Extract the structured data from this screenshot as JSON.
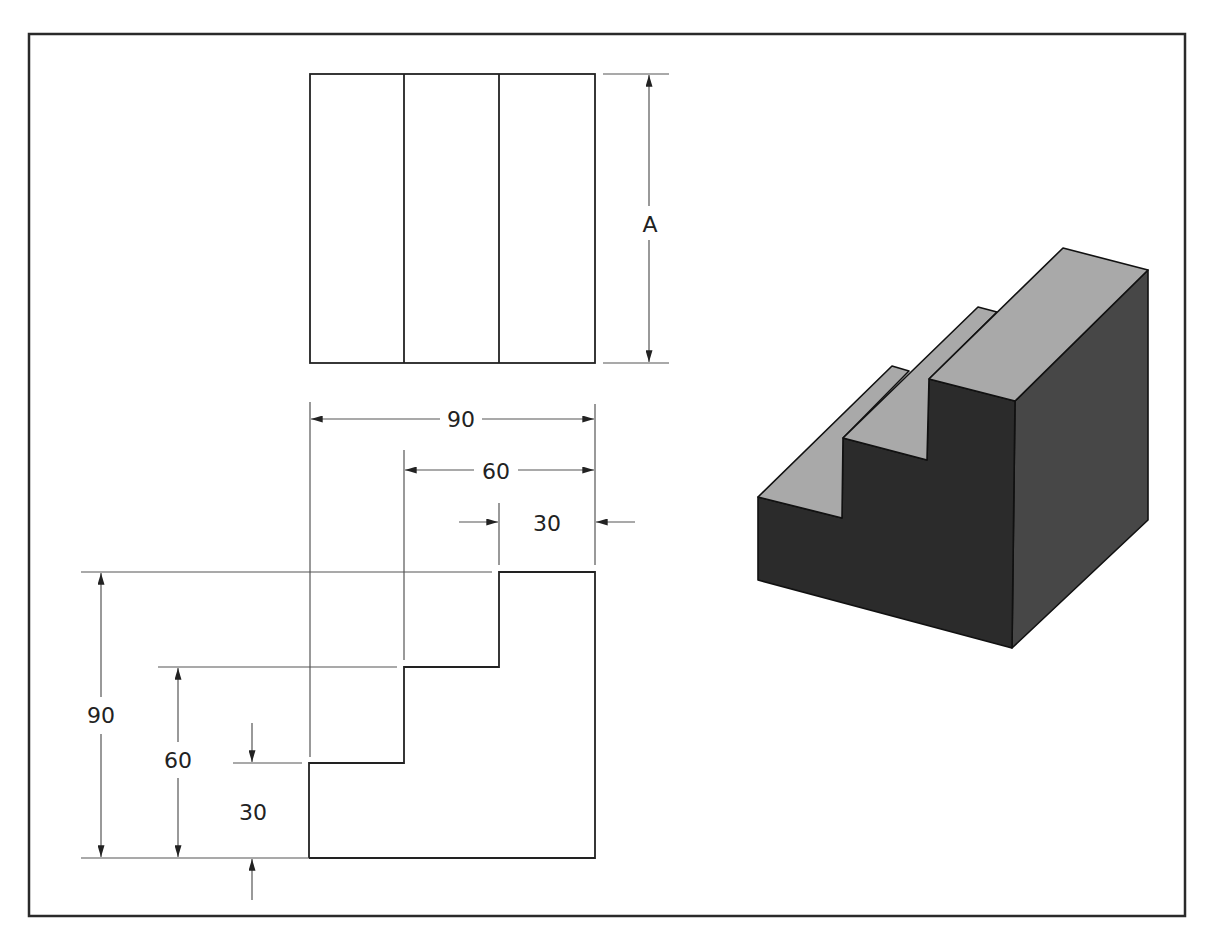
{
  "figure": {
    "type": "orthographic-and-isometric-drawing",
    "top_view": {
      "dimension_label": "A"
    },
    "front_view": {
      "horizontal_dimensions": [
        "90",
        "60",
        "30"
      ],
      "vertical_dimensions": [
        "90",
        "60",
        "30"
      ]
    },
    "isometric_view": {
      "description": "three-step staircase block",
      "colors": {
        "top_faces": "#a9a9a9",
        "front_faces": "#2b2b2b",
        "side_face": "#474747",
        "edges": "#111111"
      }
    }
  }
}
